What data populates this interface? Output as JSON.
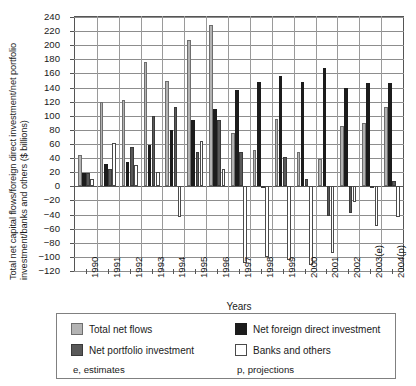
{
  "chart_data": {
    "type": "bar",
    "title": "",
    "xlabel": "Years",
    "ylabel": "Total net capital flows/foreign direct investment/net portfolio investment/banks and others ($ billions)",
    "ylim": [
      -120,
      240
    ],
    "ytick_step": 20,
    "grid": true,
    "legend_position": "bottom",
    "categories": [
      "1990",
      "1991",
      "1992",
      "1993",
      "1994",
      "1995",
      "1996",
      "1997",
      "1998",
      "1999",
      "2000",
      "2001",
      "2002",
      "2003(e)",
      "2004(p)"
    ],
    "ytick_labels": [
      "240",
      "220",
      "200",
      "180",
      "160",
      "140",
      "120",
      "100",
      "80",
      "60",
      "40",
      "20",
      "0",
      "−20",
      "−40",
      "−60",
      "−80",
      "−100",
      "−120"
    ],
    "series": [
      {
        "name": "Total net flows",
        "color": "#b3b3b3",
        "values": [
          45,
          120,
          122,
          176,
          150,
          208,
          229,
          75,
          52,
          95,
          49,
          39,
          85,
          90,
          112
        ]
      },
      {
        "name": "Net foreign direct investment",
        "color": "#1c1c1c",
        "values": [
          19,
          31,
          35,
          58,
          80,
          94,
          109,
          136,
          148,
          156,
          148,
          168,
          139,
          146,
          146
        ]
      },
      {
        "name": "Net portfolio investment",
        "color": "#595959",
        "values": [
          19,
          25,
          56,
          99,
          113,
          48,
          94,
          48,
          1,
          42,
          11,
          -42,
          -38,
          -2,
          8
        ]
      },
      {
        "name": "Banks and others",
        "color": "#ffffff",
        "values": [
          10,
          62,
          30,
          20,
          -43,
          64,
          24,
          -109,
          -100,
          -104,
          -111,
          -95,
          -22,
          -56,
          -44
        ]
      }
    ],
    "notes": {
      "estimates": "e, estimates",
      "projections": "p, projections"
    }
  }
}
